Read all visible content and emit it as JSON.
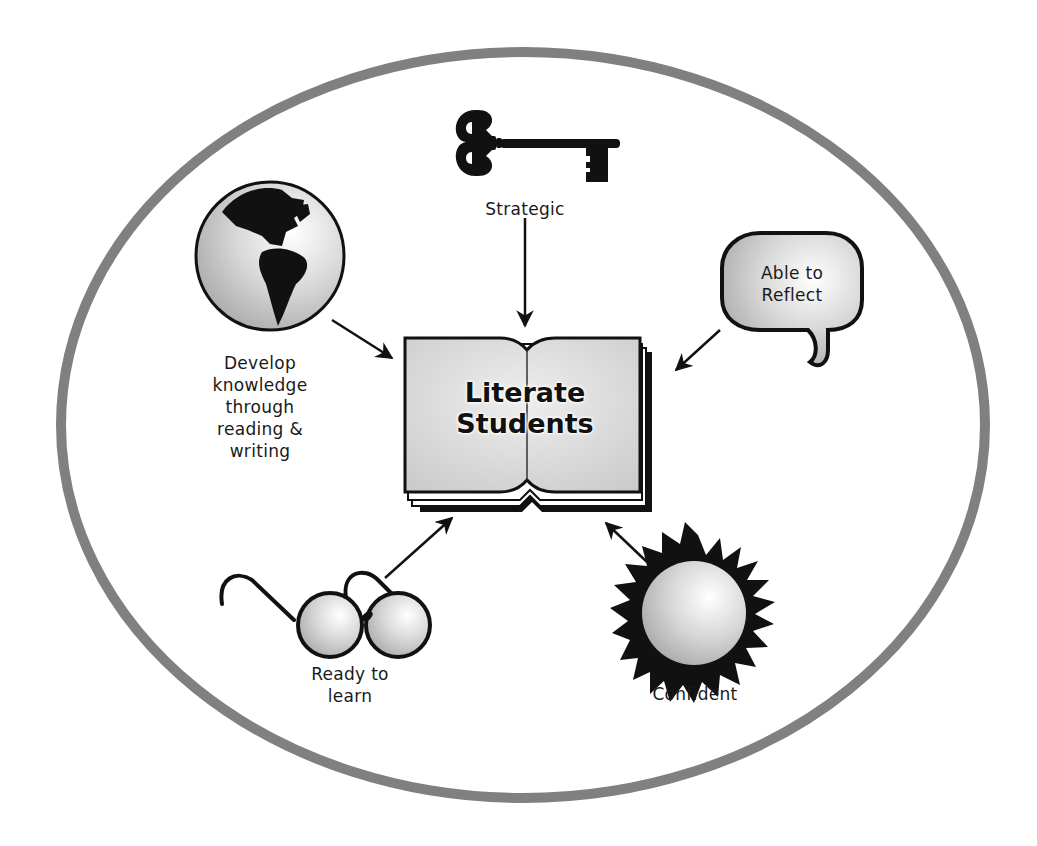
{
  "diagram": {
    "center": {
      "icon": "open-book-icon",
      "line1": "Literate",
      "line2": "Students"
    },
    "nodes": [
      {
        "id": "strategic",
        "icon": "key-icon",
        "lines": [
          "Strategic"
        ]
      },
      {
        "id": "develop",
        "icon": "globe-icon",
        "lines": [
          "Develop",
          "knowledge",
          "through",
          "reading &",
          "writing"
        ]
      },
      {
        "id": "reflect",
        "icon": "speech-bubble-icon",
        "lines": [
          "Able to",
          "Reflect"
        ]
      },
      {
        "id": "ready",
        "icon": "glasses-icon",
        "lines": [
          "Ready to",
          "learn"
        ]
      },
      {
        "id": "confident",
        "icon": "sun-icon",
        "lines": [
          "Confident"
        ]
      }
    ],
    "colors": {
      "ellipse_border": "#808080",
      "ink": "#111111",
      "fill_gray": "#d0d0d0"
    }
  }
}
